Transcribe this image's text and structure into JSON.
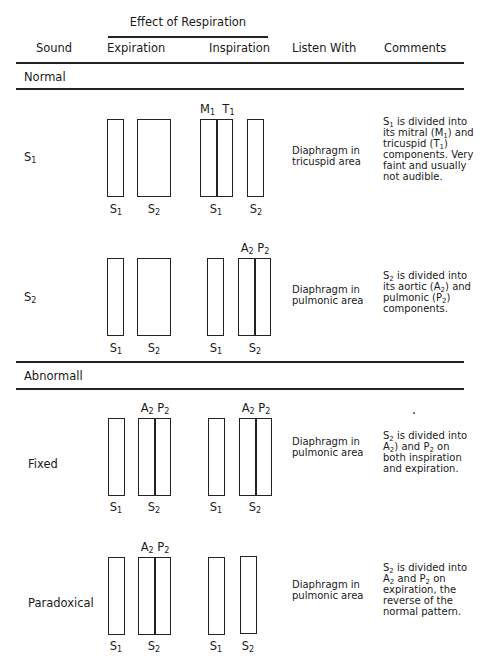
{
  "header": {
    "group_title": "Effect of Respiration",
    "columns": [
      "Sound",
      "Expiration",
      "Inspiration",
      "Listen With",
      "Comments"
    ]
  },
  "sections": [
    {
      "title": "Normal",
      "rows": [
        {
          "sound": {
            "base": "S",
            "sub": "1"
          },
          "listen_with": "Diaphragm in tricuspid area",
          "comment_html": "S<sub>1</sub> is divided into its mitral (M<sub>1</sub>) and tricuspid (T<sub>1</sub>) components. Very faint and usually not audible.",
          "comment_text": "S1 is divided into its mitral (M1) and tricuspid (T1) components. Very faint and usually not audible.",
          "expiration": [
            {
              "label": "S1",
              "split": false,
              "top": null
            },
            {
              "label": "S2",
              "split": false,
              "top": null,
              "wide": true
            }
          ],
          "inspiration": [
            {
              "label": "S1",
              "split": true,
              "top": "M1 T1"
            },
            {
              "label": "S2",
              "split": false,
              "top": null
            }
          ]
        },
        {
          "sound": {
            "base": "S",
            "sub": "2"
          },
          "listen_with": "Diaphragm in pulmonic area",
          "comment_html": "S<sub>2</sub> is divided into its aortic (A<sub>2</sub>) and pulmonic (P<sub>2</sub>) components.",
          "comment_text": "S2 is divided into its aortic (A2) and pulmonic (P2) components.",
          "expiration": [
            {
              "label": "S1",
              "split": false,
              "top": null
            },
            {
              "label": "S2",
              "split": false,
              "top": null,
              "wide": true
            }
          ],
          "inspiration": [
            {
              "label": "S1",
              "split": false,
              "top": null
            },
            {
              "label": "S2",
              "split": true,
              "top": "A2 P2"
            }
          ]
        }
      ]
    },
    {
      "title": "Abnormall",
      "rows": [
        {
          "sound": "Fixed",
          "listen_with": "Diaphragm in pulmonic area",
          "comment_html": "S<sub>2</sub> is divided into A<sub>2</sub>) and P<sub>2</sub> on both inspiration and expiration.",
          "comment_text": "S2 is divided into A2) and P2 on both inspiration and expiration.",
          "expiration": [
            {
              "label": "S1",
              "split": false,
              "top": null
            },
            {
              "label": "S2",
              "split": true,
              "top": "A2 P2"
            }
          ],
          "inspiration": [
            {
              "label": "S1",
              "split": false,
              "top": null
            },
            {
              "label": "S2",
              "split": true,
              "top": "A2 P2"
            }
          ]
        },
        {
          "sound": "Paradoxical",
          "listen_with": "Diaphragm in pulmonic area",
          "comment_html": "S<sub>2</sub> is divided into A<sub>2</sub> and P<sub>2</sub> on expiration, the reverse of the normal pattern.",
          "comment_text": "S2 is divided into A2 and P2 on expiration, the reverse of the normal pattern.",
          "expiration": [
            {
              "label": "S1",
              "split": false,
              "top": null
            },
            {
              "label": "S2",
              "split": true,
              "top": "A2 P2"
            }
          ],
          "inspiration": [
            {
              "label": "S1",
              "split": false,
              "top": null
            },
            {
              "label": "S2",
              "split": false,
              "top": null
            }
          ]
        }
      ]
    }
  ],
  "labels": {
    "S1": {
      "base": "S",
      "sub": "1"
    },
    "S2": {
      "base": "S",
      "sub": "2"
    },
    "M1": {
      "base": "M",
      "sub": "1"
    },
    "T1": {
      "base": "T",
      "sub": "1"
    },
    "A2": {
      "base": "A",
      "sub": "2"
    },
    "P2": {
      "base": "P",
      "sub": "2"
    }
  }
}
